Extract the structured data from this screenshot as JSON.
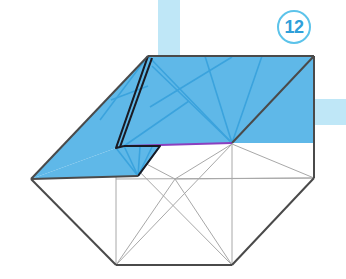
{
  "diagram": {
    "kind": "origami-folding-step",
    "step_badge": {
      "label": "12",
      "shape": "circle-outline",
      "ring_color": "#5cc3ea",
      "text_color": "#2f9fd9"
    },
    "colors": {
      "paper_colored_side": "#5fb8e8",
      "paper_colored_side_shade": "#6fc2ec",
      "paper_white_side": "#ffffff",
      "outline_dark": "#4a4a4a",
      "outline_black": "#1a1a23",
      "crease_light": "#a8a8a8",
      "crease_blue": "#3ba3dd",
      "crease_blue_dark": "#2f93cf",
      "highlight_purple": "#8b3fbf",
      "background_strip": "#bfe7f7",
      "page_background": "#ffffff"
    },
    "background_strips": [
      {
        "name": "top-vertical-strip",
        "x": 158,
        "y": 0,
        "width": 22,
        "height": 57,
        "color": "#bfe7f7"
      },
      {
        "name": "right-horizontal-strip",
        "x": 314,
        "y": 99,
        "width": 32,
        "height": 26,
        "color": "#bfe7f7"
      }
    ],
    "key_points": {
      "left_vertex": [
        31,
        179
      ],
      "right_vertex": [
        314,
        178
      ],
      "bottom_left": [
        116,
        265
      ],
      "bottom_right": [
        232,
        265
      ],
      "top_right": [
        314,
        56
      ],
      "flap_apex": [
        148,
        56
      ],
      "mid_fold_left": [
        116,
        148
      ],
      "mid_fold_right": [
        232,
        144
      ],
      "center_cross": [
        175,
        179
      ]
    },
    "annotations": {
      "purple_edge_note": "raw-edge-highlight",
      "purple_edge_from": [
        124,
        146
      ],
      "purple_edge_to": [
        232,
        143
      ]
    }
  }
}
